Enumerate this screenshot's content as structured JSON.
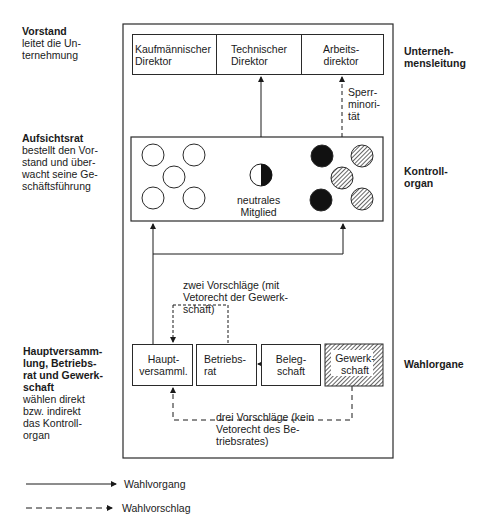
{
  "left_labels": {
    "vorstand": {
      "title": "Vorstand",
      "desc": "leitet die Un-\nternehmung"
    },
    "aufsichtsrat": {
      "title": "Aufsichtsrat",
      "desc": "bestellt den Vor-\nstand und über-\nwacht seine Ge-\nschäftsführung"
    },
    "wahl": {
      "title": "Hauptversamm-\nlung, Betriebs-\nrat und Gewerk-\nschaft",
      "desc": "wählen direkt\nbzw. indirekt\ndas Kontroll-\norgan"
    }
  },
  "right_labels": {
    "unternehmensleitung": "Unterneh-\nmensleitung",
    "kontrollorgan": "Kontroll-\norgan",
    "wahlorgane": "Wahlorgane"
  },
  "top_boxes": [
    {
      "label": "Kaufmännischer\nDirektor"
    },
    {
      "label": "Technischer\nDirektor"
    },
    {
      "label": "Arbeits-\ndirektor"
    }
  ],
  "sperrminoritaet": "Sperr-\nminori-\ntät",
  "kontrollorgan": {
    "neutral_label": "neutrales\nMitglied",
    "shareholder_members": 5,
    "employee_members": {
      "black": 2,
      "hatched": 3
    }
  },
  "bottom_boxes": [
    {
      "label": "Haupt-\nversamml."
    },
    {
      "label": "Betriebs-\nrat"
    },
    {
      "label": "Beleg-\nschaft"
    },
    {
      "label": "Gewerk-\nschaft"
    }
  ],
  "notes": {
    "zwei": "zwei Vorschläge (mit\nVetorecht der Gewerk-\nschaft)",
    "drei": "drei Vorschläge (kein\nVetorecht des Be-\ntriebsrates)"
  },
  "legend": [
    {
      "style": "solid",
      "label": "Wahlvorgang"
    },
    {
      "style": "dashed",
      "label": "Wahlvorschlag"
    }
  ],
  "colors": {
    "line": "#2a2a2a",
    "fill_black": "#111111",
    "background": "#ffffff"
  }
}
